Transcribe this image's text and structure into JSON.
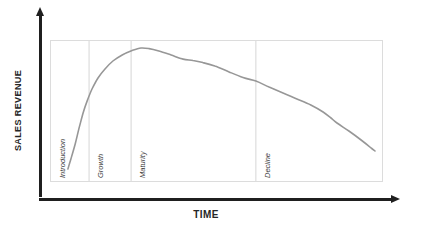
{
  "chart": {
    "y_axis_label": "SALES REVENUE",
    "x_axis_label": "TIME"
  },
  "chart_data": {
    "type": "line",
    "title": "",
    "xlabel": "TIME",
    "ylabel": "SALES REVENUE",
    "x_range": [
      0,
      100
    ],
    "y_range": [
      0,
      100
    ],
    "grid": false,
    "legend_position": "none",
    "axis_ticks": "none",
    "phases": [
      {
        "label": "Introduction",
        "x_start": 0,
        "x_end": 11.5
      },
      {
        "label": "Growth",
        "x_start": 11.5,
        "x_end": 24.2
      },
      {
        "label": "Maturity",
        "x_start": 24.2,
        "x_end": 61.9
      },
      {
        "label": "Decline",
        "x_start": 61.9,
        "x_end": 100
      }
    ],
    "series": [
      {
        "name": "sales-revenue",
        "points": [
          [
            5.1,
            8.6
          ],
          [
            6.0,
            15.7
          ],
          [
            7.3,
            26.4
          ],
          [
            8.5,
            37.9
          ],
          [
            9.7,
            48.6
          ],
          [
            10.9,
            57.1
          ],
          [
            12.4,
            65.7
          ],
          [
            14.2,
            73.6
          ],
          [
            16.3,
            80.0
          ],
          [
            18.7,
            85.7
          ],
          [
            21.5,
            90.0
          ],
          [
            24.5,
            93.2
          ],
          [
            27.2,
            95.0
          ],
          [
            29.6,
            94.6
          ],
          [
            32.6,
            92.9
          ],
          [
            36.3,
            90.0
          ],
          [
            39.9,
            87.1
          ],
          [
            42.9,
            86.1
          ],
          [
            45.9,
            84.6
          ],
          [
            49.5,
            82.1
          ],
          [
            53.8,
            77.9
          ],
          [
            58.0,
            73.9
          ],
          [
            61.9,
            71.4
          ],
          [
            65.9,
            67.1
          ],
          [
            70.1,
            62.9
          ],
          [
            74.3,
            58.6
          ],
          [
            78.5,
            54.3
          ],
          [
            82.2,
            49.3
          ],
          [
            84.6,
            45.0
          ],
          [
            86.4,
            41.4
          ],
          [
            90.0,
            35.7
          ],
          [
            93.7,
            29.3
          ],
          [
            96.7,
            23.6
          ],
          [
            97.9,
            21.4
          ]
        ]
      }
    ]
  },
  "colors": {
    "axis": "#1f1f1f",
    "curve": "#979797",
    "plot_border": "#dcdcdc",
    "phase_divider": "#d6d6d6",
    "axis_label_text": "#262626",
    "phase_label_text": "#3d3d3d",
    "background": "#ffffff"
  }
}
